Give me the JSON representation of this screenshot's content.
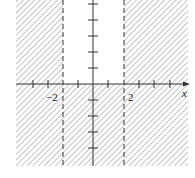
{
  "diagram": {
    "axis_labels": {
      "x": "x"
    },
    "tick_labels": {
      "neg2": "−2",
      "pos2": "2"
    },
    "boundaries": [
      {
        "line": "x = -2",
        "style": "dashed"
      },
      {
        "line": "x = 2",
        "style": "dashed"
      }
    ],
    "shaded_region": "x <= -2 or x >= 2 or y < 0",
    "colors": {
      "hatch": "#8a8a8a",
      "axis": "#333333",
      "background": "#ffffff"
    }
  }
}
